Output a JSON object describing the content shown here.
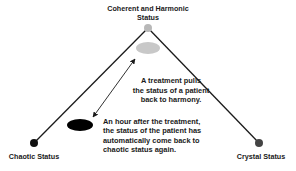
{
  "diagram": {
    "apex_label": "Coherent and Harmonic Status",
    "apex_label_lines": [
      "Coherent and Harmonic",
      "Status"
    ],
    "left_label": "Chaotic Status",
    "right_label": "Crystal Status",
    "treatment_note_lines": [
      "A treatment pulls",
      "the status of a patient",
      "back to harmony."
    ],
    "relapse_note_lines": [
      "An hour after the treatment,",
      "the status of the patient has",
      "automatically come back to",
      "chaotic status again."
    ],
    "colors": {
      "line": "#1a1a1a",
      "apex_dot": "#b8b8b8",
      "harmony_ellipse": "#c8c8c8",
      "chaotic_ellipse": "#000000",
      "left_dot": "#111111",
      "right_dot": "#444444"
    }
  }
}
